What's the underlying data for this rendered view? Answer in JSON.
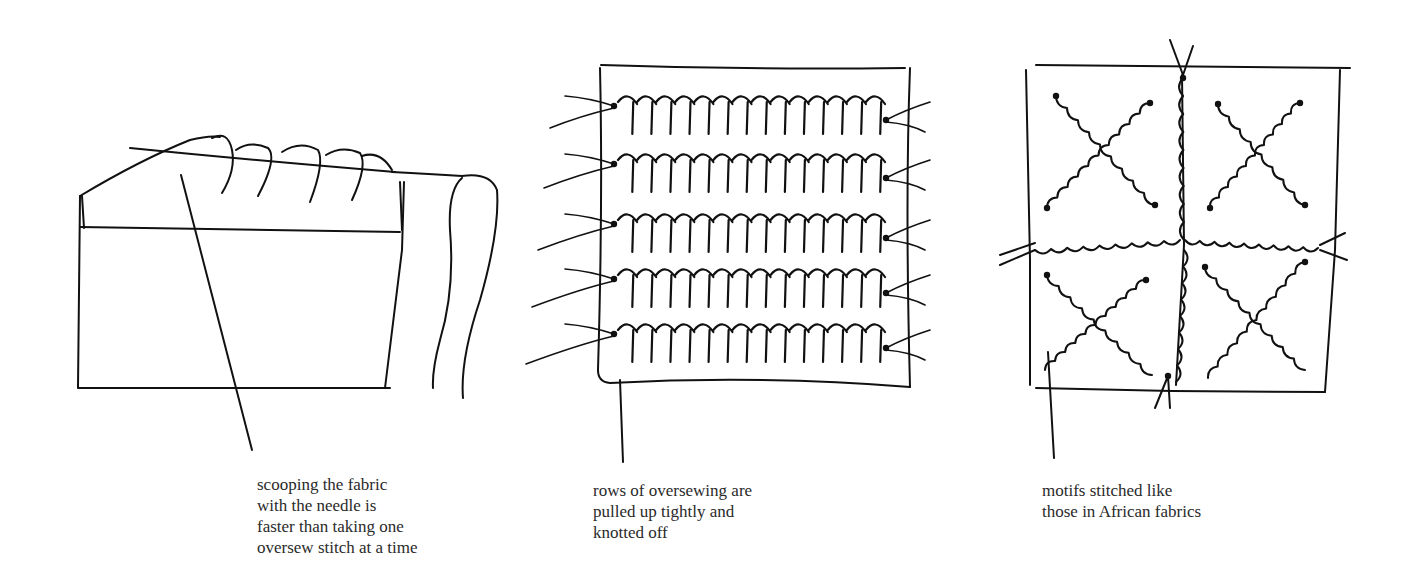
{
  "figure": {
    "panels": [
      {
        "id": "scooping",
        "illustration": "fabric folded over with needle scooping several oversew stitches and trailing thread",
        "caption_lines": [
          "scooping the fabric",
          "with the needle is",
          "faster than taking one",
          "oversew stitch at a time"
        ]
      },
      {
        "id": "rows",
        "illustration": "square of fabric with five horizontal rows of oversewing, thread ends knotted at both sides",
        "caption_lines": [
          "rows of oversewing are",
          "pulled up tightly and",
          "knotted off"
        ]
      },
      {
        "id": "motifs",
        "illustration": "square of fabric with radiating and diagonal lines of gathered stitching forming star and X motifs",
        "caption_lines": [
          "motifs stitched like",
          "those in African fabrics"
        ]
      }
    ],
    "ink_color": "#111111",
    "caption_color": "#2a2a2a",
    "background": "#ffffff"
  }
}
